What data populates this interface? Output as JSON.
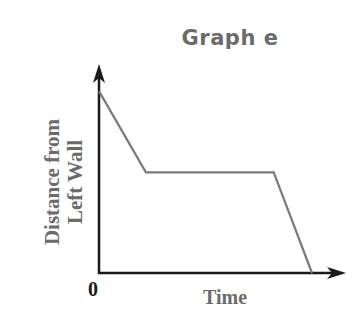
{
  "chart_data": {
    "type": "line",
    "title": "Graph e",
    "xlabel": "Time",
    "ylabel": "Distance from Left Wall",
    "origin_label": "0",
    "grid": false,
    "legend": null,
    "series": [
      {
        "name": "position",
        "points": [
          {
            "x": 0,
            "y": 0.85
          },
          {
            "x": 0.22,
            "y": 0.47
          },
          {
            "x": 0.82,
            "y": 0.47
          },
          {
            "x": 1.0,
            "y": 0.0
          }
        ]
      }
    ],
    "xlim": [
      0,
      1.1
    ],
    "ylim": [
      0,
      1.0
    ],
    "colors": {
      "line": "#7a7a7a",
      "axes": "#1a1a1a",
      "labels": "#6b6b6b"
    }
  },
  "labels": {
    "title": "Graph e",
    "ylabel_line1": "Distance from",
    "ylabel_line2": "Left Wall",
    "xlabel": "Time",
    "origin": "0"
  }
}
